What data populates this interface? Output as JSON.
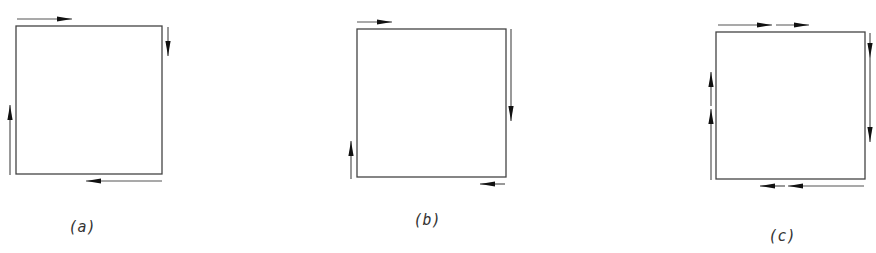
{
  "figure": {
    "background": "#ffffff",
    "stroke_color": "#444444",
    "arrowhead_color": "#111111",
    "panels": [
      {
        "id": "a",
        "label": "(a)",
        "label_pos": [
          82,
          232
        ],
        "box": {
          "x": 16,
          "y": 26,
          "w": 146,
          "h": 148
        },
        "arrows": [
          {
            "side": "top",
            "direction": "right",
            "line": [
              17,
              19,
              72,
              19
            ],
            "head_tip": [
              72,
              19
            ]
          },
          {
            "side": "right",
            "direction": "down",
            "line": [
              168,
              27,
              168,
              56
            ],
            "head_tip": [
              168,
              56
            ]
          },
          {
            "side": "bottom",
            "direction": "left",
            "line": [
              162,
              181,
              86,
              181
            ],
            "head_tip": [
              86,
              181
            ]
          },
          {
            "side": "left",
            "direction": "up",
            "line": [
              10,
              175,
              10,
              105
            ],
            "head_tip": [
              10,
              105
            ]
          }
        ]
      },
      {
        "id": "b",
        "label": "(b)",
        "label_pos": [
          427,
          225
        ],
        "box": {
          "x": 357,
          "y": 29,
          "w": 149,
          "h": 148
        },
        "arrows": [
          {
            "side": "top",
            "direction": "right",
            "line": [
              357,
              22,
              392,
              22
            ],
            "head_tip": [
              392,
              22
            ]
          },
          {
            "side": "right",
            "direction": "down",
            "line": [
              511,
              29,
              511,
              121
            ],
            "head_tip": [
              511,
              121
            ]
          },
          {
            "side": "bottom",
            "direction": "left",
            "line": [
              505,
              184,
              480,
              184
            ],
            "head_tip": [
              480,
              184
            ]
          },
          {
            "side": "left",
            "direction": "up",
            "line": [
              351,
              179,
              351,
              141
            ],
            "head_tip": [
              351,
              141
            ]
          }
        ]
      },
      {
        "id": "c",
        "label": "(c)",
        "label_pos": [
          782,
          241
        ],
        "box": {
          "x": 716,
          "y": 32,
          "w": 149,
          "h": 147
        },
        "arrows": [
          {
            "side": "top",
            "direction": "right",
            "line": [
              718,
              25,
              772,
              25
            ],
            "head_tip": [
              772,
              25
            ]
          },
          {
            "side": "top",
            "direction": "right",
            "line": [
              776,
              25,
              809,
              25
            ],
            "head_tip": [
              809,
              25
            ]
          },
          {
            "side": "right",
            "direction": "down",
            "line": [
              870,
              33,
              870,
              58
            ],
            "head_tip": [
              870,
              58
            ]
          },
          {
            "side": "right",
            "direction": "down",
            "line": [
              870,
              58,
              870,
              142
            ],
            "head_tip": [
              870,
              142
            ]
          },
          {
            "side": "bottom",
            "direction": "left",
            "line": [
              864,
              186,
              788,
              186
            ],
            "head_tip": [
              788,
              186
            ]
          },
          {
            "side": "bottom",
            "direction": "left",
            "line": [
              785,
              186,
              760,
              186
            ],
            "head_tip": [
              760,
              186
            ]
          },
          {
            "side": "left",
            "direction": "up",
            "line": [
              711,
              180,
              711,
              109
            ],
            "head_tip": [
              711,
              109
            ]
          },
          {
            "side": "left",
            "direction": "up",
            "line": [
              711,
              106,
              711,
              72
            ],
            "head_tip": [
              711,
              72
            ]
          }
        ]
      }
    ]
  }
}
